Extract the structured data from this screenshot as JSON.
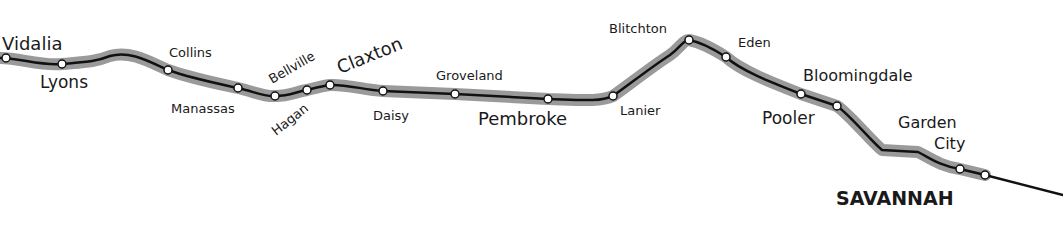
{
  "map": {
    "title": "Rail route Vidalia to Savannah",
    "colors": {
      "track": "#111111",
      "halo": "#9a9a9a",
      "station_fill": "#ffffff",
      "background": "#ffffff"
    },
    "stations": [
      {
        "name": "Vidalia",
        "x": 6,
        "y": 58
      },
      {
        "name": "Lyons",
        "x": 62,
        "y": 64
      },
      {
        "name": "Collins",
        "x": 168,
        "y": 70
      },
      {
        "name": "Manassas",
        "x": 238,
        "y": 88
      },
      {
        "name": "Bellville",
        "x": 275,
        "y": 96
      },
      {
        "name": "Hagan",
        "x": 307,
        "y": 90
      },
      {
        "name": "Claxton",
        "x": 330,
        "y": 85
      },
      {
        "name": "Daisy",
        "x": 383,
        "y": 91
      },
      {
        "name": "Groveland",
        "x": 455,
        "y": 94
      },
      {
        "name": "Pembroke",
        "x": 548,
        "y": 99
      },
      {
        "name": "Lanier",
        "x": 613,
        "y": 96
      },
      {
        "name": "Blitchton",
        "x": 689,
        "y": 40
      },
      {
        "name": "Eden",
        "x": 726,
        "y": 57
      },
      {
        "name": "Bloomingdale",
        "x": 801,
        "y": 94
      },
      {
        "name": "Pooler",
        "x": 837,
        "y": 106
      },
      {
        "name": "Garden City",
        "x": 960,
        "y": 169
      },
      {
        "name": "Savannah",
        "x": 985,
        "y": 175
      }
    ],
    "labels": {
      "vidalia": "Vidalia",
      "lyons": "Lyons",
      "collins": "Collins",
      "manassas": "Manassas",
      "bellville": "Bellville",
      "hagan": "Hagan",
      "claxton": "Claxton",
      "daisy": "Daisy",
      "groveland": "Groveland",
      "pembroke": "Pembroke",
      "lanier": "Lanier",
      "blitchton": "Blitchton",
      "eden": "Eden",
      "bloomingdale": "Bloomingdale",
      "pooler": "Pooler",
      "garden": "Garden",
      "city": "City",
      "savannah": "SAVANNAH"
    }
  }
}
